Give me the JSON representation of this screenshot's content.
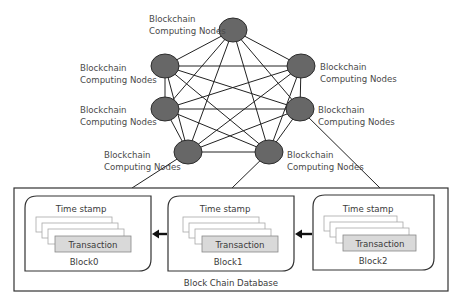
{
  "diagram": {
    "node_label_line1": "Blockchain",
    "node_label_line2": "Computing Nodes",
    "nodes": [
      {
        "id": "top",
        "cx": 233,
        "cy": 30,
        "label": [
          "Blockchain",
          "Computing Nodes"
        ],
        "label_x": 149,
        "label_y": 19,
        "anchor": "start"
      },
      {
        "id": "upper-left",
        "cx": 165,
        "cy": 66,
        "label": [
          "Blockchain",
          "Computing Nodes"
        ],
        "label_x": 80,
        "label_y": 71
      },
      {
        "id": "upper-right",
        "cx": 301,
        "cy": 66,
        "label": [
          "Blockchain",
          "Computing Nodes"
        ],
        "label_x": 320,
        "label_y": 70
      },
      {
        "id": "mid-left",
        "cx": 165,
        "cy": 109,
        "label": [
          "Blockchain",
          "Computing Nodes"
        ],
        "label_x": 80,
        "label_y": 113
      },
      {
        "id": "mid-right",
        "cx": 300,
        "cy": 109,
        "label": [
          "Blockchain",
          "Computing Nodes"
        ],
        "label_x": 318,
        "label_y": 113
      },
      {
        "id": "lower-left",
        "cx": 188,
        "cy": 152,
        "label": [
          "Blockchain",
          "Computing Nodes"
        ],
        "label_x": 104,
        "label_y": 158
      },
      {
        "id": "lower-right",
        "cx": 269,
        "cy": 152,
        "label": [
          "Blockchain",
          "Computing Nodes"
        ],
        "label_x": 287,
        "label_y": 158
      }
    ],
    "database": {
      "title": "Block Chain Database",
      "blocks": [
        {
          "name": "Block0",
          "timestamp_label": "Time stamp",
          "transaction_label": "Transaction"
        },
        {
          "name": "Block1",
          "timestamp_label": "Time stamp",
          "transaction_label": "Transaction"
        },
        {
          "name": "Block2",
          "timestamp_label": "Time stamp",
          "transaction_label": "Transaction"
        }
      ]
    },
    "colors": {
      "node_fill": "#676767",
      "node_stroke": "#2c2c2c",
      "transaction_fill": "#d9d9d9",
      "text": "#4a4a4a"
    }
  }
}
